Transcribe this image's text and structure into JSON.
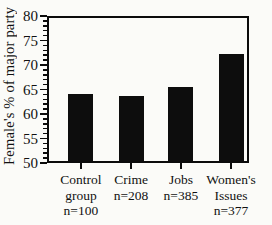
{
  "chart_data": {
    "type": "bar",
    "title": "",
    "ylabel": "Female's % of major party",
    "xlabel": "",
    "ylim": [
      50,
      80
    ],
    "ytick_major": 5,
    "ytick_minor": 1,
    "yticks": [
      50,
      55,
      60,
      65,
      70,
      75,
      80
    ],
    "grid": false,
    "legend": false,
    "bar_color": "#0d0d0d",
    "categories": [
      "Control group",
      "Crime",
      "Jobs",
      "Women's Issues"
    ],
    "category_label_lines": [
      [
        "Control",
        "group",
        "n=100"
      ],
      [
        "Crime",
        "n=208"
      ],
      [
        "Jobs",
        "n=385"
      ],
      [
        "Women's",
        "Issues",
        "n=377"
      ]
    ],
    "sample_sizes": [
      "n=100",
      "n=208",
      "n=385",
      "n=377"
    ],
    "values": [
      64.0,
      63.7,
      65.5,
      72.2
    ]
  }
}
